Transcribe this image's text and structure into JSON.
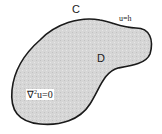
{
  "diagram": {
    "boundary_label": "C",
    "boundary_condition": "u=h",
    "domain_label": "D",
    "equation": {
      "operator": "∇",
      "exponent": "2",
      "rest": "u=0"
    },
    "colors": {
      "fill": "#d6d6d6",
      "stroke": "#1a1a1a",
      "background": "#ffffff"
    }
  }
}
